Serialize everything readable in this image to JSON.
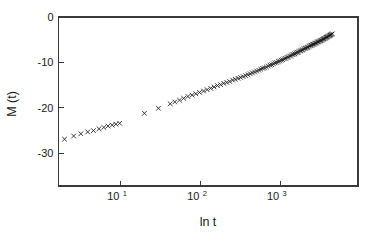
{
  "chart_data": {
    "type": "scatter",
    "title": "",
    "xlabel": "ln  t",
    "ylabel": "M (t)",
    "xscale": "log",
    "yscale": "linear",
    "xlim": [
      1.68,
      9440
    ],
    "ylim": [
      -37.2,
      0
    ],
    "grid": false,
    "legend": null,
    "marker": "x",
    "marker_color": "#1a1a1a",
    "axis_color": "#3a3a3a",
    "background_color": "#ffffff",
    "xticks": [
      {
        "value": 10,
        "label_base": "10",
        "label_exp": "1"
      },
      {
        "value": 100,
        "label_base": "10",
        "label_exp": "2"
      },
      {
        "value": 1000,
        "label_base": "10",
        "label_exp": "3"
      }
    ],
    "yticks": [
      {
        "value": 0,
        "label": "0"
      },
      {
        "value": -10,
        "label": "-10"
      },
      {
        "value": -20,
        "label": "-20"
      },
      {
        "value": -30,
        "label": "-30"
      }
    ],
    "series": [
      {
        "name": "M(t)",
        "x": [
          2.0,
          2.6,
          3.2,
          3.9,
          4.6,
          5.4,
          6.2,
          7.0,
          7.9,
          8.8,
          9.8,
          20.0,
          30.0,
          42.0,
          48.0,
          55.0,
          62.0,
          70.0,
          79.0,
          88.0,
          98.0,
          110.0,
          122.0,
          135.0,
          149.0,
          164.0,
          180.0,
          197.0,
          215.0,
          234.0,
          254.0,
          275.0,
          297.0,
          320.0,
          344.0,
          369.0,
          395.0,
          422.0,
          450.0,
          479.0,
          509.0,
          540.0,
          572.0,
          605.0,
          639.0,
          674.0,
          710.0,
          747.0,
          785.0,
          824.0,
          864.0,
          905.0,
          947.0,
          990.0,
          1034.0,
          1079.0,
          1125.0,
          1172.0,
          1220.0,
          1269.0,
          1319.0,
          1370.0,
          1422.0,
          1475.0,
          1529.0,
          1584.0,
          1640.0,
          1697.0,
          1755.0,
          1814.0,
          1874.0,
          1935.0,
          1997.0,
          2060.0,
          2124.0,
          2189.0,
          2255.0,
          2322.0,
          2390.0,
          2459.0,
          2529.0,
          2600.0,
          2672.0,
          2745.0,
          2819.0,
          2894.0,
          2970.0,
          3047.0,
          3125.0,
          3204.0,
          3284.0,
          3365.0,
          3447.0,
          3530.0,
          3614.0,
          3699.0,
          3785.0,
          3872.0,
          3960.0,
          4049.0,
          4139.0,
          4230.0,
          4322.0,
          4415.0,
          4509.0
        ],
        "y": [
          -26.9,
          -26.2,
          -25.7,
          -25.3,
          -25.0,
          -24.6,
          -24.3,
          -24.0,
          -23.8,
          -23.6,
          -23.4,
          -21.2,
          -20.1,
          -19.1,
          -18.7,
          -18.3,
          -17.9,
          -17.5,
          -17.2,
          -16.9,
          -16.6,
          -16.3,
          -16.0,
          -15.7,
          -15.4,
          -15.1,
          -14.9,
          -14.6,
          -14.4,
          -14.2,
          -13.9,
          -13.7,
          -13.5,
          -13.3,
          -13.1,
          -12.9,
          -12.7,
          -12.5,
          -12.3,
          -12.1,
          -11.9,
          -11.7,
          -11.5,
          -11.3,
          -11.2,
          -11.0,
          -10.8,
          -10.6,
          -10.5,
          -10.3,
          -10.1,
          -10.0,
          -9.8,
          -9.7,
          -9.5,
          -9.4,
          -9.2,
          -9.1,
          -8.9,
          -8.8,
          -8.6,
          -8.5,
          -8.3,
          -8.2,
          -8.1,
          -7.9,
          -7.8,
          -7.7,
          -7.5,
          -7.4,
          -7.3,
          -7.2,
          -7.0,
          -6.9,
          -6.8,
          -6.7,
          -6.6,
          -6.4,
          -6.3,
          -6.2,
          -6.1,
          -6.0,
          -5.9,
          -5.8,
          -5.7,
          -5.6,
          -5.5,
          -5.4,
          -5.3,
          -5.2,
          -5.1,
          -5.0,
          -4.9,
          -4.8,
          -4.7,
          -4.6,
          -4.5,
          -4.4,
          -4.3,
          -4.2,
          -4.1,
          -4.0,
          -3.9,
          -3.8,
          -3.7
        ]
      }
    ]
  }
}
